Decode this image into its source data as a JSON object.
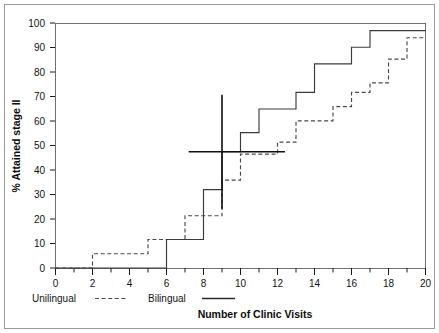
{
  "chart_data": {
    "type": "line",
    "subtype": "step-cumulative",
    "title": "",
    "xlabel": "Number of Clinic Visits",
    "ylabel": "% Attained stage II",
    "xlim": [
      0,
      20
    ],
    "ylim": [
      0,
      103
    ],
    "x_ticks": [
      0,
      2,
      4,
      6,
      8,
      10,
      12,
      14,
      16,
      18,
      20
    ],
    "x_tick_labels": [
      "0",
      "2",
      "4",
      "6",
      "8",
      "10",
      "12",
      "14",
      "16",
      "18",
      "20"
    ],
    "x_minor_ticks": [
      1,
      3,
      5,
      7,
      9,
      11,
      13,
      15,
      17,
      19
    ],
    "y_ticks": [
      0,
      10,
      20,
      30,
      40,
      50,
      60,
      70,
      80,
      90,
      100
    ],
    "y_tick_labels": [
      "0",
      "10",
      "20",
      "30",
      "40",
      "50",
      "60",
      "70",
      "80",
      "90",
      "100"
    ],
    "grid": false,
    "legend_position": "below-axis-left",
    "series": [
      {
        "name": "Unilingual",
        "style": "dashed",
        "color": "#4a4a4a",
        "x": [
          0,
          1,
          2,
          3,
          4,
          5,
          6,
          7,
          8,
          9,
          10,
          11,
          12,
          13,
          14,
          15,
          16,
          17,
          18,
          19,
          20
        ],
        "values": [
          0,
          0,
          6,
          6,
          6,
          12,
          12,
          22,
          22,
          37,
          48,
          48,
          53,
          62,
          62,
          68,
          74,
          78,
          88,
          97,
          97
        ]
      },
      {
        "name": "Bilingual",
        "style": "solid",
        "color": "#3b3b3b",
        "x": [
          0,
          1,
          2,
          3,
          4,
          5,
          6,
          7,
          8,
          9,
          10,
          11,
          12,
          13,
          14,
          15,
          16,
          17,
          18,
          19,
          20
        ],
        "values": [
          0,
          0,
          0,
          0,
          0,
          0,
          12,
          12,
          33,
          49,
          57,
          67,
          67,
          74,
          86,
          86,
          93,
          100,
          100,
          100,
          100
        ]
      }
    ],
    "annotations": [
      {
        "name": "median-vertical-reference",
        "kind": "vline",
        "x": 9,
        "y_start": 25,
        "y_end": 73
      },
      {
        "name": "median-horizontal-reference",
        "kind": "hline",
        "y": 49,
        "x_start": 7.2,
        "x_end": 12.4
      }
    ],
    "legend": [
      {
        "label": "Unilingual",
        "style": "dashed"
      },
      {
        "label": "Bilingual",
        "style": "solid"
      }
    ]
  },
  "axis": {
    "x_title": "Number of Clinic Visits",
    "y_title": "% Attained stage II"
  },
  "legend": {
    "unilingual_label": "Unilingual",
    "bilingual_label": "Bilingual"
  },
  "y_labels": {
    "t0": "0",
    "t1": "10",
    "t2": "20",
    "t3": "30",
    "t4": "40",
    "t5": "50",
    "t6": "60",
    "t7": "70",
    "t8": "80",
    "t9": "90",
    "t10": "100"
  },
  "x_labels": {
    "t0": "0",
    "t1": "2",
    "t2": "4",
    "t3": "6",
    "t4": "8",
    "t5": "10",
    "t6": "12",
    "t7": "14",
    "t8": "16",
    "t9": "18",
    "t10": "20"
  }
}
